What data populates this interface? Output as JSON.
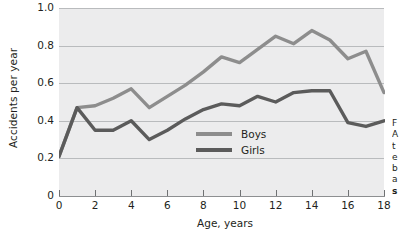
{
  "chart_data": {
    "type": "line",
    "title": "",
    "xlabel": "Age, years",
    "ylabel": "Accidents per year",
    "x": [
      0,
      1,
      2,
      3,
      4,
      5,
      6,
      7,
      8,
      9,
      10,
      11,
      12,
      13,
      14,
      15,
      16,
      17,
      18
    ],
    "series": [
      {
        "name": "Boys",
        "color": "#8d8d8d",
        "values": [
          0.21,
          0.47,
          0.48,
          0.52,
          0.57,
          0.47,
          0.53,
          0.59,
          0.66,
          0.74,
          0.71,
          0.78,
          0.85,
          0.81,
          0.88,
          0.83,
          0.73,
          0.77,
          0.55
        ]
      },
      {
        "name": "Girls",
        "color": "#5b5b5b",
        "values": [
          0.21,
          0.47,
          0.35,
          0.35,
          0.4,
          0.3,
          0.35,
          0.41,
          0.46,
          0.49,
          0.48,
          0.53,
          0.5,
          0.55,
          0.56,
          0.56,
          0.39,
          0.37,
          0.4
        ]
      }
    ],
    "xlim": [
      0,
      18
    ],
    "ylim": [
      0,
      1.0
    ],
    "xticks": [
      0,
      2,
      4,
      6,
      8,
      10,
      12,
      14,
      16,
      18
    ],
    "xticklabels": [
      "0",
      "2",
      "4",
      "6",
      "8",
      "10",
      "12",
      "14",
      "16",
      "18"
    ],
    "yticks": [
      0,
      0.2,
      0.4,
      0.6,
      0.8,
      1.0
    ],
    "yticklabels": [
      "0",
      "0.2",
      "0.4",
      "0.6",
      "0.8",
      "1.0"
    ],
    "grid": "horizontal",
    "legend_position": "center",
    "plot_background": "#ececed"
  },
  "legend": {
    "entries": [
      {
        "label": "Boys",
        "color": "#8d8d8d"
      },
      {
        "label": "Girls",
        "color": "#5b5b5b"
      }
    ]
  },
  "side_caption": {
    "lines": [
      "F",
      "A",
      "t",
      "e",
      "b",
      "a"
    ],
    "bold_line": "s"
  }
}
